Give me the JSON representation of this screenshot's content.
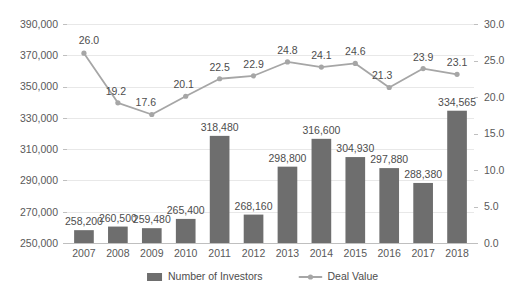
{
  "chart_data": {
    "type": "bar",
    "title": "",
    "subtitle": "",
    "xlabel": "",
    "ylabel": "",
    "grid": true,
    "legend_position": "bottom",
    "categories": [
      "2007",
      "2008",
      "2009",
      "2010",
      "2011",
      "2012",
      "2013",
      "2014",
      "2015",
      "2016",
      "2017",
      "2018"
    ],
    "series": [
      {
        "name": "Number of Investors",
        "type": "bar",
        "axis": "left",
        "color": "#6e6e6e",
        "values": [
          258200,
          260500,
          259480,
          265400,
          318480,
          268160,
          298800,
          316600,
          304930,
          297880,
          288380,
          334565
        ],
        "labels": [
          "258,200",
          "260,500",
          "259,480",
          "265,400",
          "318,480",
          "268,160",
          "298,800",
          "316,600",
          "304,930",
          "297,880",
          "288,380",
          "334,565"
        ]
      },
      {
        "name": "Deal Value",
        "type": "line",
        "axis": "right",
        "color": "#a6a6a6",
        "values": [
          26.0,
          19.2,
          17.6,
          20.1,
          22.5,
          22.9,
          24.8,
          24.1,
          24.6,
          21.3,
          23.9,
          23.1
        ],
        "labels": [
          "26.0",
          "19.2",
          "17.6",
          "20.1",
          "22.5",
          "22.9",
          "24.8",
          "24.1",
          "24.6",
          "21.3",
          "23.9",
          "23.1"
        ]
      }
    ],
    "left_axis": {
      "min": 250000,
      "max": 390000,
      "step": 20000,
      "ticks": [
        250000,
        270000,
        290000,
        310000,
        330000,
        350000,
        370000,
        390000
      ],
      "tick_labels": [
        "250,000",
        "270,000",
        "290,000",
        "310,000",
        "330,000",
        "350,000",
        "370,000",
        "390,000"
      ]
    },
    "right_axis": {
      "min": 0.0,
      "max": 30.0,
      "step": 5.0,
      "ticks": [
        0,
        5,
        10,
        15,
        20,
        25,
        30
      ],
      "tick_labels": [
        "0.0",
        "5.0",
        "10.0",
        "15.0",
        "20.0",
        "25.0",
        "30.0"
      ]
    }
  },
  "legend": {
    "items": [
      {
        "label": "Number of Investors",
        "marker": "bar-swatch",
        "color": "#6e6e6e"
      },
      {
        "label": "Deal Value",
        "marker": "line-marker",
        "color": "#a6a6a6"
      }
    ]
  },
  "colors": {
    "bar": "#6e6e6e",
    "line": "#a6a6a6",
    "gridline": "#e8e8e8",
    "axis": "#bfbfbf",
    "text": "#595959",
    "label_text": "#4d4d4d",
    "background": "#ffffff"
  }
}
